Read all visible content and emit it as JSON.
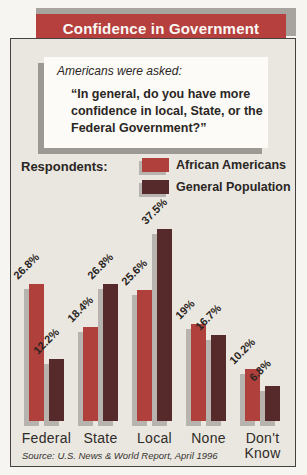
{
  "title": "Confidence in Government",
  "intro": {
    "lead": "Americans were asked:",
    "question_lines": [
      "“In general, do you have more",
      "confidence in local, State, or the",
      "Federal Government?”"
    ]
  },
  "legend": {
    "label": "Respondents:",
    "series": [
      {
        "name": "African Americans",
        "color": "#b0403c"
      },
      {
        "name": "General Population",
        "color": "#562a2b"
      }
    ]
  },
  "chart_data": {
    "type": "bar",
    "categories": [
      "Federal",
      "State",
      "Local",
      "None",
      "Don't Know"
    ],
    "series": [
      {
        "name": "African Americans",
        "color": "#b0403c",
        "values": [
          26.8,
          18.4,
          25.6,
          19,
          10.2
        ],
        "labels": [
          "26.8%",
          "18.4%",
          "25.6%",
          "19%",
          "10.2%"
        ]
      },
      {
        "name": "General Population",
        "color": "#562a2b",
        "values": [
          12.2,
          26.8,
          37.5,
          16.7,
          6.8
        ],
        "labels": [
          "12.2%",
          "26.8%",
          "37.5%",
          "16.7%",
          "6.8%"
        ]
      }
    ],
    "ylim": [
      0,
      40
    ],
    "value_label_format": "percent",
    "value_label_rotation": -45,
    "grid": false,
    "legend_position": "top-right",
    "title": "Confidence in Government"
  },
  "source": "Source: U.S. News & World Report, April 1996",
  "palette": {
    "banner": "#b6403d",
    "banner_accent": "#a7a39e",
    "panel_bg": "#eae7e1",
    "bar_shadow": "#b7b3ae",
    "box_shadow": "#9c9893",
    "text_dark": "#2a2623"
  }
}
